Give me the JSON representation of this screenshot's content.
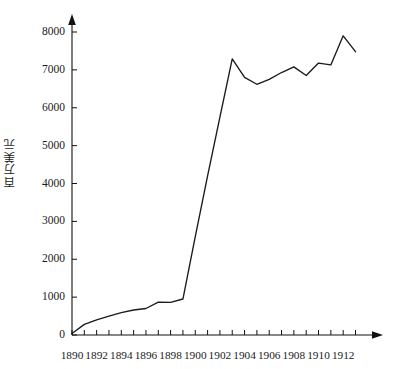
{
  "chart_data": {
    "type": "line",
    "title": "",
    "subtitle": "",
    "xlabel": "",
    "ylabel": "百万美元",
    "xlim": [
      1890,
      1913
    ],
    "ylim": [
      0,
      8400
    ],
    "grid": false,
    "legend": null,
    "annotations": [],
    "axis_style": {
      "arrows": true,
      "tick_every_x": 1,
      "tick_every_y": 1000,
      "line_color": "#111111",
      "series_color": "#1a1a1a"
    },
    "y_ticks": [
      0,
      1000,
      2000,
      3000,
      4000,
      5000,
      6000,
      7000,
      8000
    ],
    "y_tick_labels": [
      "0",
      "1000",
      "2000",
      "3000",
      "4000",
      "5000",
      "6000",
      "7000",
      "8000"
    ],
    "x_ticks": [
      1890,
      1891,
      1892,
      1893,
      1894,
      1895,
      1896,
      1897,
      1898,
      1899,
      1900,
      1901,
      1902,
      1903,
      1904,
      1905,
      1906,
      1907,
      1908,
      1909,
      1910,
      1911,
      1912,
      1913
    ],
    "x_tick_labels_shown": [
      "1890",
      "1892",
      "1894",
      "1896",
      "1898",
      "1900",
      "1902",
      "1904",
      "1906",
      "1908",
      "1910",
      "1912"
    ],
    "x_labelled_years": [
      1890,
      1892,
      1894,
      1896,
      1898,
      1900,
      1902,
      1904,
      1906,
      1908,
      1910,
      1912
    ],
    "x": [
      1890,
      1891,
      1892,
      1893,
      1894,
      1895,
      1896,
      1897,
      1898,
      1899,
      1900,
      1901,
      1902,
      1903,
      1904,
      1905,
      1906,
      1907,
      1908,
      1909,
      1910,
      1911,
      1912,
      1913
    ],
    "values": [
      40,
      280,
      400,
      500,
      590,
      660,
      700,
      870,
      860,
      950,
      2600,
      4200,
      5750,
      7290,
      6800,
      6620,
      6750,
      6930,
      7080,
      6850,
      7180,
      7130,
      7900,
      7480
    ],
    "series": [
      {
        "name": "百万美元",
        "color": "#1a1a1a",
        "values": [
          40,
          280,
          400,
          500,
          590,
          660,
          700,
          870,
          860,
          950,
          2600,
          4200,
          5750,
          7290,
          6800,
          6620,
          6750,
          6930,
          7080,
          6850,
          7180,
          7130,
          7900,
          7480
        ]
      }
    ]
  },
  "axis": {
    "y_axis_name": "y-axis",
    "x_axis_name": "x-axis"
  }
}
